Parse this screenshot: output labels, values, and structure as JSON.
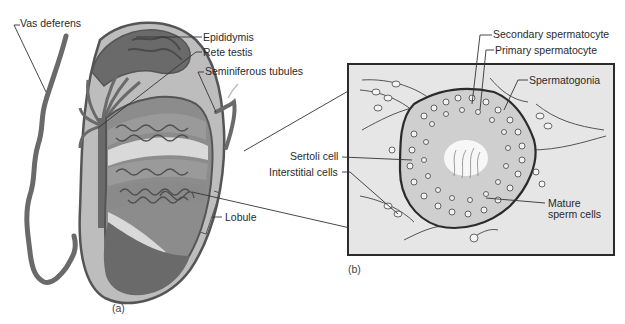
{
  "figure": {
    "panels": [
      {
        "id": "a",
        "tag": "(a)",
        "subject": "testis cross-section",
        "labels": {
          "vas_deferens": "Vas deferens",
          "epididymis": "Epididymis",
          "rete_testis": "Rete testis",
          "seminiferous_tubules": "Seminiferous tubules",
          "lobule": "Lobule"
        }
      },
      {
        "id": "b",
        "tag": "(b)",
        "subject": "seminiferous tubule cross-section",
        "labels": {
          "secondary_spermatocyte": "Secondary spermatocyte",
          "primary_spermatocyte": "Primary spermatocyte",
          "spermatogonia": "Spermatogonia",
          "sertoli_cell": "Sertoli cell",
          "interstitial_cells": "Interstitial cells",
          "mature_sperm_cells_line1": "Mature",
          "mature_sperm_cells_line2": "sperm cells"
        }
      }
    ],
    "colors": {
      "outline": "#555555",
      "tunica_light": "#bdbdbd",
      "tissue_dark": "#6a6a6a",
      "tissue_mid": "#8c8c8c",
      "tubule_pale": "#d9d9d9",
      "inset_bg": "#e6e6e6",
      "inset_border": "#2b2b2b",
      "leader": "#333333"
    }
  }
}
